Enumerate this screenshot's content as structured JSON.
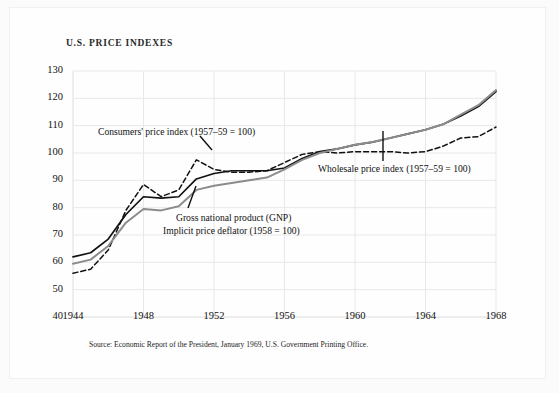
{
  "page": {
    "title": "U.S. PRICE INDEXES",
    "source_note": "Source: Economic Report of the President, January 1969, U.S. Government Printing Office."
  },
  "annotations": {
    "consumers": "Consumers' price index (1957–59 = 100)",
    "wholesale": "Wholesale price index (1957–59 = 100)",
    "gnp_line1": "Gross national product (GNP)",
    "gnp_line2": "Implicit price deflator (1958 = 100)"
  },
  "colors": {
    "consumers": "#111111",
    "wholesale": "#111111",
    "gnp": "#8c8c8c",
    "grid": "#e8e8e8",
    "axis": "#3a3a3a",
    "background": "#fefefe"
  },
  "chart_data": {
    "type": "line",
    "title": "U.S. PRICE INDEXES",
    "xlabel": "",
    "ylabel": "",
    "xlim": [
      1944,
      1968
    ],
    "ylim": [
      40,
      130
    ],
    "yticks": [
      40,
      50,
      60,
      70,
      80,
      90,
      100,
      110,
      120,
      130
    ],
    "xticks": [
      1944,
      1948,
      1952,
      1956,
      1960,
      1964,
      1968
    ],
    "grid": true,
    "legend": "annotations-inline",
    "x": [
      1944,
      1945,
      1946,
      1947,
      1948,
      1949,
      1950,
      1951,
      1952,
      1953,
      1954,
      1955,
      1956,
      1957,
      1958,
      1959,
      1960,
      1961,
      1962,
      1963,
      1964,
      1965,
      1966,
      1967,
      1968
    ],
    "series": [
      {
        "name": "Consumers' price index (1957-59 = 100)",
        "style": "solid",
        "color": "#111111",
        "values": [
          62.0,
          63.5,
          68.5,
          77.5,
          84.0,
          83.5,
          84.0,
          90.5,
          92.5,
          93.5,
          93.5,
          93.5,
          94.5,
          98.0,
          100.5,
          101.5,
          103.0,
          104.0,
          105.5,
          107.0,
          108.5,
          110.5,
          113.5,
          117.0,
          122.5
        ]
      },
      {
        "name": "Wholesale price index (1957-59 = 100)",
        "style": "dashed",
        "color": "#111111",
        "values": [
          56.0,
          57.5,
          64.5,
          79.0,
          88.5,
          84.0,
          86.5,
          97.5,
          94.0,
          93.0,
          93.0,
          93.5,
          96.5,
          99.5,
          100.5,
          100.0,
          100.5,
          100.5,
          100.5,
          100.0,
          100.5,
          102.5,
          105.5,
          106.0,
          109.5
        ]
      },
      {
        "name": "Gross national product (GNP) Implicit price deflator (1958 = 100)",
        "style": "solid",
        "color": "#8c8c8c",
        "values": [
          59.5,
          61.0,
          66.0,
          74.5,
          79.5,
          79.0,
          80.5,
          86.5,
          88.0,
          89.0,
          90.0,
          91.0,
          94.0,
          97.5,
          100.0,
          101.5,
          103.0,
          104.0,
          105.5,
          107.0,
          108.5,
          110.5,
          114.0,
          117.5,
          123.0
        ]
      }
    ]
  }
}
